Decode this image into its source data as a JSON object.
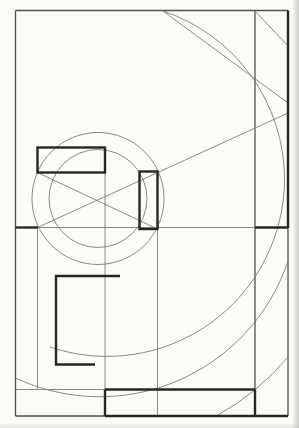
{
  "canvas": {
    "width": 299,
    "height": 428
  },
  "paper": {
    "background": "#fbfbf8",
    "edge_shadow": "#aaa7a0"
  },
  "drawing": {
    "stroke_colors": {
      "thin": "#7d7d7d",
      "medium": "#4f4f4f",
      "bold": "#262626"
    },
    "stroke_widths": {
      "thin": 0.9,
      "medium": 1.3,
      "bold": 2.4
    },
    "elements": [
      {
        "type": "line",
        "name": "frame-top",
        "x1": 15.5,
        "y1": 10.5,
        "x2": 288,
        "y2": 10.5,
        "w": "medium"
      },
      {
        "type": "line",
        "name": "frame-left",
        "x1": 15.5,
        "y1": 10.5,
        "x2": 15.5,
        "y2": 416,
        "w": "medium"
      },
      {
        "type": "line",
        "name": "frame-right-lower",
        "x1": 288,
        "y1": 228,
        "x2": 288,
        "y2": 416,
        "w": "medium"
      },
      {
        "type": "line",
        "name": "frame-bottom-left",
        "x1": 15.5,
        "y1": 416,
        "x2": 105,
        "y2": 416,
        "w": "medium"
      },
      {
        "type": "line",
        "name": "vertical-line-right-column",
        "x1": 255,
        "y1": 10.5,
        "x2": 255,
        "y2": 390,
        "w": "medium"
      },
      {
        "type": "line",
        "name": "vertical-line-left",
        "x1": 37.5,
        "y1": 227.5,
        "x2": 37.5,
        "y2": 389.5,
        "w": "thin"
      },
      {
        "type": "line",
        "name": "vertical-line-center",
        "x1": 105,
        "y1": 148,
        "x2": 105,
        "y2": 390,
        "w": "thin"
      },
      {
        "type": "line",
        "name": "vertical-line-inner-right",
        "x1": 157.5,
        "y1": 229,
        "x2": 157.5,
        "y2": 416,
        "w": "thin"
      },
      {
        "type": "line",
        "name": "horizontal-mid-line",
        "x1": 38,
        "y1": 227.5,
        "x2": 255,
        "y2": 227.5,
        "w": "thin"
      },
      {
        "type": "line",
        "name": "horizontal-lower-left",
        "x1": 15.5,
        "y1": 389.5,
        "x2": 105,
        "y2": 389.5,
        "w": "thin"
      },
      {
        "type": "line",
        "name": "diagonal-cross-down",
        "x1": 37.5,
        "y1": 172.5,
        "x2": 157.5,
        "y2": 229,
        "w": "thin"
      },
      {
        "type": "line",
        "name": "diagonal-cross-up-long",
        "x1": 37.5,
        "y1": 227.5,
        "x2": 288,
        "y2": 113,
        "w": "thin"
      },
      {
        "type": "line",
        "name": "chord-top-right",
        "x1": 163,
        "y1": 11,
        "x2": 288,
        "y2": 103,
        "w": "thin"
      },
      {
        "type": "line",
        "name": "corner-diagonal-top-right",
        "x1": 255,
        "y1": 11,
        "x2": 288,
        "y2": 46,
        "w": "thin"
      },
      {
        "type": "circle",
        "name": "circle-inner",
        "cx": 98,
        "cy": 198.5,
        "r": 49,
        "w": "thin"
      },
      {
        "type": "circle",
        "name": "circle-outer",
        "cx": 98,
        "cy": 198.5,
        "r": 66,
        "w": "thin"
      },
      {
        "type": "path",
        "name": "arc-large-sweep",
        "d": "M 163 11 A 177.5 177.5 0 0 1 284.5 179 A 177.5 177.5 0 0 1 50 347",
        "w": "thin"
      },
      {
        "type": "path",
        "name": "arc-bottom-sweep",
        "d": "M 15.5 378 A 198.5 198.5 0 0 0 288 261",
        "w": "thin"
      },
      {
        "type": "path",
        "name": "arc-corner-bottom-right",
        "d": "M 216 416 A 247 247 0 0 0 288 357",
        "w": "thin"
      },
      {
        "type": "line",
        "name": "frame-right-upper-bold",
        "x1": 288,
        "y1": 10.5,
        "x2": 288,
        "y2": 228,
        "w": "bold"
      },
      {
        "type": "line",
        "name": "frame-bottom-right-bold",
        "x1": 105,
        "y1": 416,
        "x2": 288,
        "y2": 416,
        "w": "bold"
      },
      {
        "type": "line",
        "name": "baseline-left-bold",
        "x1": 15.5,
        "y1": 227.5,
        "x2": 38,
        "y2": 227.5,
        "w": "bold"
      },
      {
        "type": "line",
        "name": "baseline-right-bold",
        "x1": 255,
        "y1": 227.5,
        "x2": 288,
        "y2": 227.5,
        "w": "bold"
      },
      {
        "type": "line",
        "name": "ground-line-bold",
        "x1": 105,
        "y1": 389.5,
        "x2": 255,
        "y2": 389.5,
        "w": "bold"
      },
      {
        "type": "line",
        "name": "vertical-center-bold-foot",
        "x1": 105,
        "y1": 389.5,
        "x2": 105,
        "y2": 416,
        "w": "bold"
      },
      {
        "type": "line",
        "name": "vertical-right-column-bold-foot",
        "x1": 255,
        "y1": 389.5,
        "x2": 255,
        "y2": 416,
        "w": "bold"
      },
      {
        "type": "rect",
        "name": "rectangle-top-left-bold",
        "x": 37.5,
        "y": 147.5,
        "width": 67.5,
        "height": 25,
        "w": "bold"
      },
      {
        "type": "rect",
        "name": "rectangle-right-bold",
        "x": 139.5,
        "y": 171.5,
        "width": 18,
        "height": 57.5,
        "w": "bold"
      },
      {
        "type": "polyline",
        "name": "bracket-bold",
        "points": "120,276 56,276 56,364.5 95,364.5",
        "w": "bold"
      }
    ]
  }
}
